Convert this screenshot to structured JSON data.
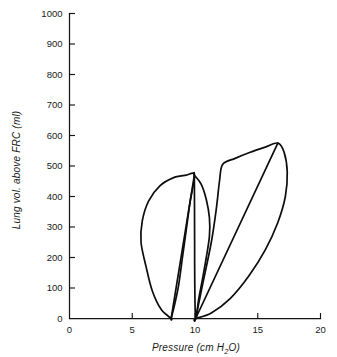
{
  "chart_data": {
    "type": "line",
    "title": "",
    "xlabel": "Pressure (cm H2O)",
    "xlabel_prefix": "Pressure (cm H",
    "xlabel_sub": "2",
    "xlabel_suffix": "O)",
    "ylabel": "Lung vol. above FRC (ml)",
    "xlim": [
      0,
      20
    ],
    "ylim": [
      0,
      1000
    ],
    "xticks": [
      0,
      5,
      10,
      15,
      20
    ],
    "yticks": [
      0,
      100,
      200,
      300,
      400,
      500,
      600,
      700,
      800,
      900,
      1000
    ],
    "xtick_labels": [
      "0",
      "5",
      "10",
      "15",
      "20"
    ],
    "ytick_labels": [
      "0",
      "100",
      "200",
      "300",
      "400",
      "500",
      "600",
      "700",
      "800",
      "900",
      "1000"
    ],
    "grid": false,
    "legend": null,
    "line_color": "#0d0d0d",
    "axis_color": "#151515",
    "background": "#ffffff",
    "series": [
      {
        "name": "loop-1-low-compliance",
        "description": "Left pressure-volume hysteresis loop, inflation limb bulging left, deflation limb near-linear",
        "closed": true,
        "points": [
          [
            8.1,
            0
          ],
          [
            7.3,
            30
          ],
          [
            6.6,
            90
          ],
          [
            6.1,
            170
          ],
          [
            5.7,
            250
          ],
          [
            5.8,
            320
          ],
          [
            6.3,
            385
          ],
          [
            7.2,
            435
          ],
          [
            8.3,
            462
          ],
          [
            9.3,
            470
          ],
          [
            9.95,
            470
          ],
          [
            9.6,
            380
          ],
          [
            9.3,
            290
          ],
          [
            9.0,
            200
          ],
          [
            8.7,
            110
          ],
          [
            8.4,
            50
          ],
          [
            8.1,
            0
          ]
        ]
      },
      {
        "name": "loop-2-mid-narrow",
        "description": "Narrow middle loop sharing the left apex, deflation limb sweeping right and down to 10 cmH2O",
        "closed": true,
        "points": [
          [
            9.95,
            470
          ],
          [
            10.5,
            440
          ],
          [
            10.9,
            390
          ],
          [
            11.15,
            330
          ],
          [
            11.15,
            270
          ],
          [
            10.9,
            200
          ],
          [
            10.6,
            130
          ],
          [
            10.3,
            65
          ],
          [
            10.05,
            0
          ],
          [
            9.98,
            120
          ],
          [
            9.97,
            250
          ],
          [
            9.96,
            370
          ],
          [
            9.95,
            470
          ]
        ]
      },
      {
        "name": "loop-3-high-compliance",
        "description": "Right pressure-volume hysteresis loop, inflation limb with knee near 12 cmH2O / 505 ml, apex at 16.6 cmH2O / 575 ml",
        "closed": true,
        "points": [
          [
            10.05,
            0
          ],
          [
            10.6,
            110
          ],
          [
            11.3,
            250
          ],
          [
            11.7,
            360
          ],
          [
            11.95,
            450
          ],
          [
            12.2,
            505
          ],
          [
            13.2,
            525
          ],
          [
            14.4,
            545
          ],
          [
            15.6,
            562
          ],
          [
            16.6,
            575
          ],
          [
            17.1,
            545
          ],
          [
            17.35,
            480
          ],
          [
            17.2,
            400
          ],
          [
            16.6,
            315
          ],
          [
            15.6,
            225
          ],
          [
            14.3,
            140
          ],
          [
            12.8,
            65
          ],
          [
            11.3,
            18
          ],
          [
            10.05,
            0
          ]
        ]
      },
      {
        "name": "loop-3-diagonal-chord",
        "description": "Straight compliance chord from origin of right loop to its apex",
        "closed": false,
        "points": [
          [
            10.05,
            0
          ],
          [
            16.6,
            575
          ]
        ]
      },
      {
        "name": "loop-1-diagonal-chord",
        "description": "Straight compliance chord from origin of left loop to its apex",
        "closed": false,
        "points": [
          [
            8.1,
            0
          ],
          [
            9.95,
            470
          ]
        ]
      }
    ]
  }
}
